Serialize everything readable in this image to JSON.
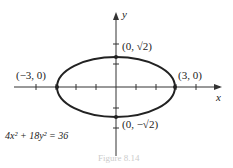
{
  "figure": {
    "axis_x_label": "x",
    "axis_y_label": "y",
    "equation": "4x² + 18y² = 36",
    "caption": "Figure 8.14",
    "points": [
      {
        "label": "(−3, 0)"
      },
      {
        "label": "(3, 0)"
      },
      {
        "label": "(0, √2)"
      },
      {
        "label": "(0, −√2)"
      }
    ],
    "colors": {
      "curve": "#222222",
      "axes": "#333333"
    }
  }
}
